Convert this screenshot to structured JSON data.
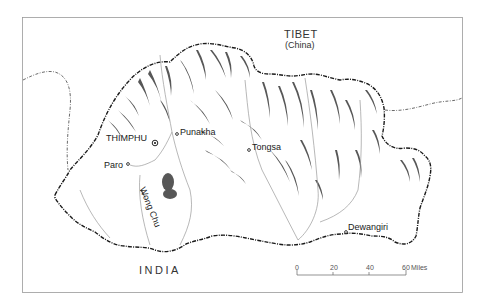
{
  "map": {
    "title": "Bhutan",
    "regions": {
      "north": {
        "name": "TIBET",
        "sub": "(China)"
      },
      "south": {
        "name": "INDIA"
      }
    },
    "cities": [
      {
        "name": "THIMPHU",
        "type": "capital"
      },
      {
        "name": "Punakha",
        "type": "town"
      },
      {
        "name": "Paro",
        "type": "town"
      },
      {
        "name": "Tongsa",
        "type": "town"
      },
      {
        "name": "Dewangiri",
        "type": "town"
      }
    ],
    "rivers": [
      {
        "name": "Wong Chu"
      }
    ],
    "scale": {
      "ticks": [
        "0",
        "20",
        "40",
        "60"
      ],
      "unit": "Miles"
    },
    "colors": {
      "background": "#ffffff",
      "frame": "#888888",
      "border": "#222222",
      "relief": "#333333",
      "river": "#999999"
    }
  }
}
